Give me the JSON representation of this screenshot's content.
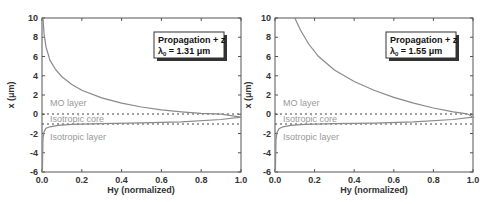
{
  "chart_data": [
    {
      "type": "line",
      "title": "",
      "legend": {
        "line1": "Propagation + z",
        "line2_prefix": "λ",
        "line2_sub": "0",
        "line2_value": " = 1.31 μm"
      },
      "xlabel": "Hy (normalized)",
      "ylabel": "x (μm)",
      "xlim": [
        0.0,
        1.0
      ],
      "ylim": [
        -6,
        10
      ],
      "xticks": [
        "0.0",
        "0.2",
        "0.4",
        "0.6",
        "0.8",
        "1.0"
      ],
      "yticks": [
        "10",
        "8",
        "6",
        "4",
        "2",
        "0",
        "-2",
        "-4",
        "-6"
      ],
      "grid": false,
      "region_labels": [
        "MO layer",
        "Isotropic core",
        "Isotropic layer"
      ],
      "boundaries": [
        0,
        -1
      ],
      "series": [
        {
          "name": "Hy profile",
          "x": [
            0.005,
            0.01,
            0.02,
            0.04,
            0.07,
            0.1,
            0.15,
            0.2,
            0.3,
            0.4,
            0.5,
            0.6,
            0.7,
            0.8,
            0.9,
            1.0,
            0.9,
            0.7,
            0.5,
            0.3,
            0.15,
            0.08,
            0.04,
            0.02,
            0.01,
            0.005,
            0.002
          ],
          "y": [
            10,
            8.4,
            7.0,
            5.6,
            4.6,
            3.9,
            3.1,
            2.5,
            1.7,
            1.15,
            0.75,
            0.45,
            0.25,
            0.1,
            0.02,
            -0.3,
            -0.55,
            -0.8,
            -0.9,
            -0.98,
            -1.05,
            -1.15,
            -1.3,
            -1.45,
            -1.8,
            -2.5,
            -6
          ]
        }
      ]
    },
    {
      "type": "line",
      "title": "",
      "legend": {
        "line1": "Propagation + z",
        "line2_prefix": "λ",
        "line2_sub": "0",
        "line2_value": " = 1.55 μm"
      },
      "xlabel": "Hy (normalized)",
      "ylabel": "x (μm)",
      "xlim": [
        0.0,
        1.0
      ],
      "ylim": [
        -6,
        10
      ],
      "xticks": [
        "0.0",
        "0.2",
        "0.4",
        "0.6",
        "0.8",
        "1.0"
      ],
      "yticks": [
        "10",
        "8",
        "6",
        "4",
        "2",
        "0",
        "-2",
        "-4",
        "-6"
      ],
      "grid": false,
      "region_labels": [
        "MO layer",
        "Isotropic core",
        "Isotropic layer"
      ],
      "boundaries": [
        0,
        -1
      ],
      "series": [
        {
          "name": "Hy profile",
          "x": [
            0.1,
            0.13,
            0.17,
            0.22,
            0.3,
            0.4,
            0.5,
            0.6,
            0.7,
            0.8,
            0.9,
            0.97,
            1.0,
            0.9,
            0.7,
            0.5,
            0.3,
            0.15,
            0.08,
            0.04,
            0.02,
            0.01,
            0.005,
            0.002
          ],
          "y": [
            10,
            8.7,
            7.3,
            6.0,
            4.6,
            3.4,
            2.5,
            1.75,
            1.15,
            0.65,
            0.25,
            0.05,
            -0.3,
            -0.55,
            -0.8,
            -0.92,
            -0.98,
            -1.05,
            -1.15,
            -1.3,
            -1.5,
            -1.9,
            -2.6,
            -6
          ]
        }
      ]
    }
  ]
}
